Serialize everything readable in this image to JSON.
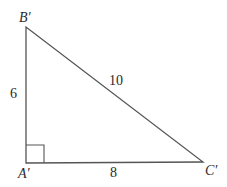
{
  "diagram": {
    "type": "right-triangle",
    "vertices": {
      "B": {
        "label": "B′",
        "x": 26,
        "y": 27
      },
      "A": {
        "label": "A′",
        "x": 26,
        "y": 163
      },
      "C": {
        "label": "C′",
        "x": 203,
        "y": 162
      }
    },
    "sides": {
      "AB": "6",
      "BC": "10",
      "AC": "8"
    },
    "right_angle_at": "A′",
    "line_color": "#555555"
  }
}
